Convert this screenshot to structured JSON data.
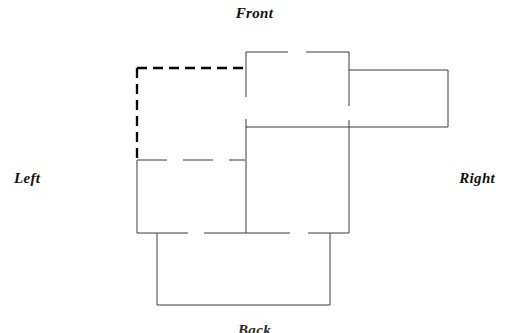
{
  "page": {
    "background_color": "#ffffff",
    "width": 509,
    "height": 333
  },
  "labels": {
    "front": "Front",
    "left": "Left",
    "right": "Right",
    "back": "Back"
  },
  "diagram": {
    "title": "Front",
    "type": "box-net-unfolded-plan",
    "stroke_color": "#1a1a1a",
    "dashed_stroke_color": "#000000",
    "stroke_width": 1,
    "dashed_stroke_width": 2.2,
    "dash_pattern": "9,6",
    "panels": [
      {
        "name": "left-top-panel",
        "style": "dashed",
        "x": 137,
        "y": 68,
        "width": 108,
        "height": 92
      },
      {
        "name": "left-bottom-panel",
        "style": "solid",
        "x": 137,
        "y": 160,
        "width": 108,
        "height": 73
      },
      {
        "name": "front-top-panel",
        "style": "solid",
        "x": 246,
        "y": 52,
        "width": 103,
        "height": 75
      },
      {
        "name": "front-bottom-panel",
        "style": "solid",
        "x": 246,
        "y": 127,
        "width": 103,
        "height": 106
      },
      {
        "name": "right-panel",
        "style": "solid",
        "x": 348,
        "y": 70,
        "width": 100,
        "height": 57
      },
      {
        "name": "back-panel",
        "style": "solid",
        "x": 157,
        "y": 233,
        "width": 173,
        "height": 72
      }
    ]
  }
}
